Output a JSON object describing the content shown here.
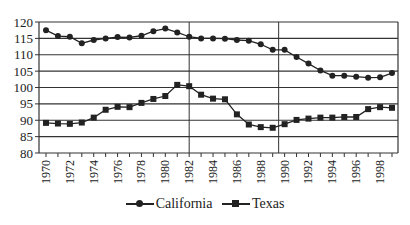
{
  "chart_data": {
    "type": "line",
    "title": "",
    "xlabel": "",
    "ylabel": "",
    "ylim": [
      80,
      120
    ],
    "yticks": [
      80,
      85,
      90,
      95,
      100,
      105,
      110,
      115,
      120
    ],
    "xtick_labels": [
      "1970",
      "1972",
      "1974",
      "1976",
      "1978",
      "1980",
      "1982",
      "1984",
      "1986",
      "1988",
      "1990",
      "1992",
      "1994",
      "1996",
      "1998"
    ],
    "grid": "horizontal",
    "vertical_reference_lines": [
      1982,
      1989.5
    ],
    "legend_position": "bottom",
    "x": [
      1970,
      1971,
      1972,
      1973,
      1974,
      1975,
      1976,
      1977,
      1978,
      1979,
      1980,
      1981,
      1982,
      1983,
      1984,
      1985,
      1986,
      1987,
      1988,
      1989,
      1990,
      1991,
      1992,
      1993,
      1994,
      1995,
      1996,
      1997,
      1998,
      1999
    ],
    "series": [
      {
        "name": "California",
        "marker": "circle",
        "values": [
          117.5,
          115.7,
          115.5,
          113.5,
          114.5,
          115.0,
          115.4,
          115.3,
          115.8,
          117.2,
          118.0,
          116.8,
          115.5,
          115.0,
          115.0,
          114.9,
          114.5,
          114.3,
          113.2,
          111.5,
          111.5,
          109.3,
          107.3,
          105.2,
          103.6,
          103.6,
          103.3,
          103.0,
          103.1,
          104.4
        ]
      },
      {
        "name": "Texas",
        "marker": "square",
        "values": [
          89.2,
          89.0,
          88.9,
          89.3,
          90.8,
          93.2,
          94.1,
          94.0,
          95.3,
          96.5,
          97.4,
          100.8,
          100.4,
          97.8,
          96.6,
          96.4,
          91.8,
          88.7,
          87.9,
          87.7,
          88.8,
          90.1,
          90.5,
          90.8,
          90.8,
          91.0,
          91.0,
          93.4,
          94.0,
          93.8
        ]
      }
    ]
  },
  "legend": {
    "items": [
      {
        "label": "California",
        "icon": "circle-marker-line"
      },
      {
        "label": "Texas",
        "icon": "square-marker-line"
      }
    ]
  }
}
